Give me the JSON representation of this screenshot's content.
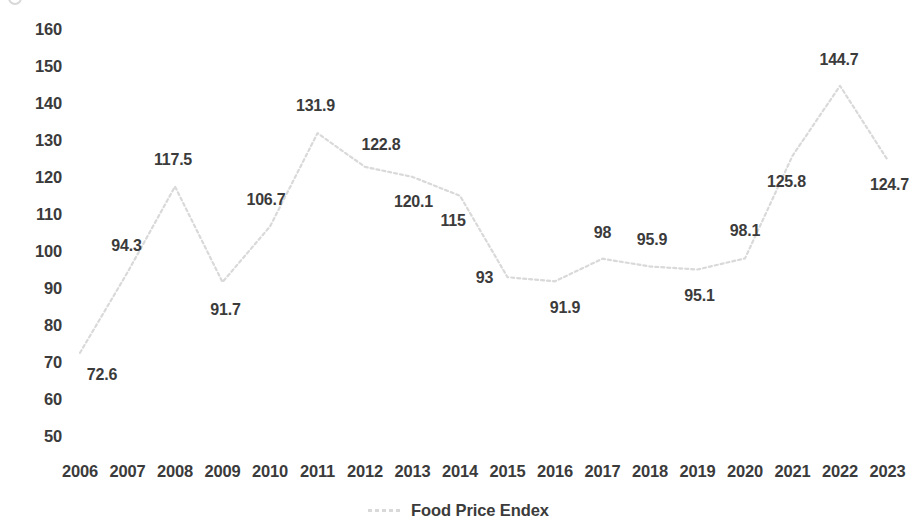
{
  "chart_data": {
    "type": "line",
    "title": "",
    "xlabel": "",
    "ylabel": "",
    "categories": [
      "2006",
      "2007",
      "2008",
      "2009",
      "2010",
      "2011",
      "2012",
      "2013",
      "2014",
      "2015",
      "2016",
      "2017",
      "2018",
      "2019",
      "2020",
      "2021",
      "2022",
      "2023"
    ],
    "values": [
      72.6,
      94.3,
      117.5,
      91.7,
      106.7,
      131.9,
      122.8,
      120.1,
      115,
      93,
      91.9,
      98,
      95.9,
      95.1,
      98.1,
      125.8,
      144.7,
      124.7
    ],
    "point_labels": [
      "72.6",
      "94.3",
      "117.5",
      "91.7",
      "106.7",
      "131.9",
      "122.8",
      "120.1",
      "115",
      "93",
      "91.9",
      "98",
      "95.9",
      "95.1",
      "98.1",
      "125.8",
      "144.7",
      "124.7"
    ],
    "series": [
      {
        "name": "Food Price Endex",
        "values": [
          72.6,
          94.3,
          117.5,
          91.7,
          106.7,
          131.9,
          122.8,
          120.1,
          115,
          93,
          91.9,
          98,
          95.9,
          95.1,
          98.1,
          125.8,
          144.7,
          124.7
        ],
        "color": "#d9d9d9",
        "line_style": "dotted"
      }
    ],
    "y_ticks": [
      160,
      150,
      140,
      130,
      120,
      110,
      100,
      90,
      80,
      70,
      60,
      50
    ],
    "y_tick_labels": [
      "160",
      "150",
      "140",
      "130",
      "120",
      "110",
      "100",
      "90",
      "80",
      "70",
      "60",
      "50"
    ],
    "ylim": [
      45,
      163
    ],
    "grid": false,
    "legend_position": "bottom",
    "legend": [
      "Food Price Endex"
    ]
  },
  "legend": {
    "label": "Food Price Endex"
  },
  "label_offsets": [
    {
      "dx": 22,
      "dy": 22
    },
    {
      "dx": -1,
      "dy": -26
    },
    {
      "dx": -2,
      "dy": -27
    },
    {
      "dx": 3,
      "dy": 28
    },
    {
      "dx": -4,
      "dy": -27
    },
    {
      "dx": -2,
      "dy": -27
    },
    {
      "dx": 16,
      "dy": -22
    },
    {
      "dx": 1,
      "dy": 25
    },
    {
      "dx": -7,
      "dy": 25
    },
    {
      "dx": -23,
      "dy": 1
    },
    {
      "dx": 10,
      "dy": 27
    },
    {
      "dx": 0,
      "dy": -26
    },
    {
      "dx": 2,
      "dy": -26
    },
    {
      "dx": 2,
      "dy": 27
    },
    {
      "dx": 0,
      "dy": -27
    },
    {
      "dx": -6,
      "dy": 26
    },
    {
      "dx": -1,
      "dy": -26
    },
    {
      "dx": 2,
      "dy": 25
    }
  ]
}
